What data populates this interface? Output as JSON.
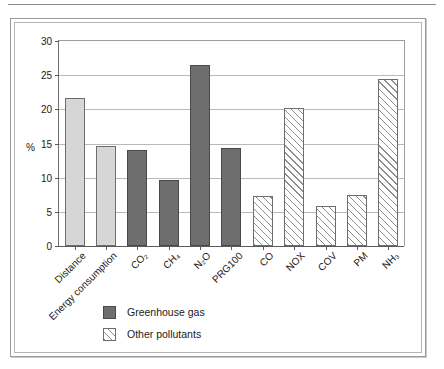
{
  "chart_data": {
    "type": "bar",
    "title": "",
    "xlabel": "",
    "ylabel": "%",
    "ylim": [
      0,
      30
    ],
    "yticks": [
      0,
      5,
      10,
      15,
      20,
      25,
      30
    ],
    "grid": true,
    "legend_position": "below-plot-left",
    "categories": [
      "Distance",
      "Energy consumption",
      "CO2",
      "CH4",
      "N2O",
      "PRG100",
      "CO",
      "NOX",
      "COV",
      "PM",
      "NH3"
    ],
    "category_labels_html": [
      "Distance",
      "Energy consumption",
      "CO₂",
      "CH₄",
      "N₂O",
      "PRG100",
      "CO",
      "NOX",
      "COV",
      "PM",
      "NH₃"
    ],
    "values": [
      21.6,
      14.7,
      14.1,
      9.7,
      26.5,
      14.3,
      7.3,
      20.2,
      5.9,
      7.5,
      24.5
    ],
    "series_style": [
      "light",
      "light",
      "dark",
      "dark",
      "dark",
      "dark",
      "hatch",
      "hatch",
      "hatch",
      "hatch",
      "hatch"
    ],
    "legend": [
      {
        "label": "Greenhouse gas",
        "style": "dark"
      },
      {
        "label": "Other pollutants",
        "style": "hatch"
      }
    ],
    "colors": {
      "light_bar": "#d6d6d6",
      "dark_bar": "#6e6e6e",
      "hatch_line": "#8c8c8c",
      "bar_border": "#6d6d6d",
      "gridline": "#b9b9b9",
      "axis": "#5a5a5a",
      "text": "#1a1a1a",
      "frame": "#9a9a9a",
      "background": "#ffffff"
    }
  },
  "axis": {
    "y_title": "%",
    "tick_labels": [
      "0",
      "5",
      "10",
      "15",
      "20",
      "25",
      "30"
    ]
  },
  "legend": {
    "greenhouse_label": "Greenhouse gas",
    "pollutants_label": "Other pollutants"
  }
}
